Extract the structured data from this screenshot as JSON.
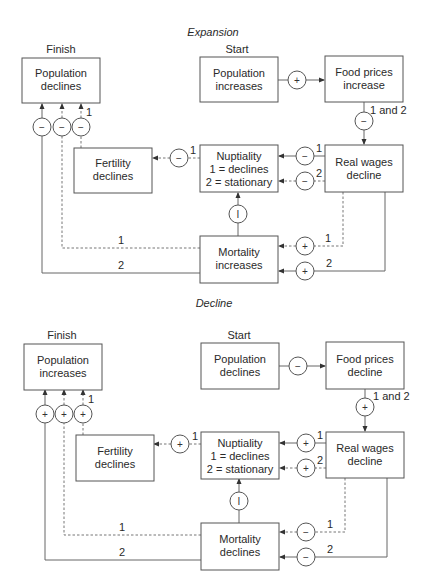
{
  "expansion": {
    "title": "Expansion",
    "finish_label": "Finish",
    "start_label": "Start",
    "boxes": {
      "population_finish": [
        "Population",
        "declines"
      ],
      "population_start": [
        "Population",
        "increases"
      ],
      "food_prices": [
        "Food prices",
        "increase"
      ],
      "real_wages": [
        "Real wages",
        "decline"
      ],
      "nuptiality": [
        "Nuptiality",
        "1 = declines",
        "2 = stationary"
      ],
      "fertility": [
        "Fertility",
        "declines"
      ],
      "mortality": [
        "Mortality",
        "increases"
      ]
    },
    "signs": {
      "pop_to_food": "+",
      "food_to_wages": "−",
      "wages_to_nupt_1": "−",
      "wages_to_nupt_2": "−",
      "nupt_to_fert": "−",
      "mort_to_nupt": "I",
      "wages_to_mort_1": "+",
      "wages_to_mort_2": "+",
      "finish_a": "−",
      "finish_b": "−",
      "finish_c": "−"
    },
    "path_labels": {
      "food_to_wages": "1 and 2",
      "wages_to_nupt_1": "1",
      "wages_to_nupt_2": "2",
      "nupt_to_fert": "1",
      "finish_c": "1",
      "mort_to_finish_1": "1",
      "mort_to_finish_2": "2",
      "wages_to_mort_1": "1",
      "wages_to_mort_2": "2"
    }
  },
  "decline": {
    "title": "Decline",
    "finish_label": "Finish",
    "start_label": "Start",
    "boxes": {
      "population_finish": [
        "Population",
        "increases"
      ],
      "population_start": [
        "Population",
        "declines"
      ],
      "food_prices": [
        "Food prices",
        "decline"
      ],
      "real_wages": [
        "Real wages",
        "decline"
      ],
      "nuptiality": [
        "Nuptiality",
        "1 = declines",
        "2 = stationary"
      ],
      "fertility": [
        "Fertility",
        "declines"
      ],
      "mortality": [
        "Mortality",
        "declines"
      ]
    },
    "signs": {
      "pop_to_food": "−",
      "food_to_wages": "+",
      "wages_to_nupt_1": "+",
      "wages_to_nupt_2": "+",
      "nupt_to_fert": "+",
      "mort_to_nupt": "I",
      "wages_to_mort_1": "−",
      "wages_to_mort_2": "−",
      "finish_a": "+",
      "finish_b": "+",
      "finish_c": "+"
    },
    "path_labels": {
      "food_to_wages": "1 and 2",
      "wages_to_nupt_1": "1",
      "wages_to_nupt_2": "2",
      "nupt_to_fert": "1",
      "finish_c": "1",
      "mort_to_finish_1": "1",
      "mort_to_finish_2": "2",
      "wages_to_mort_1": "1",
      "wages_to_mort_2": "2"
    }
  }
}
